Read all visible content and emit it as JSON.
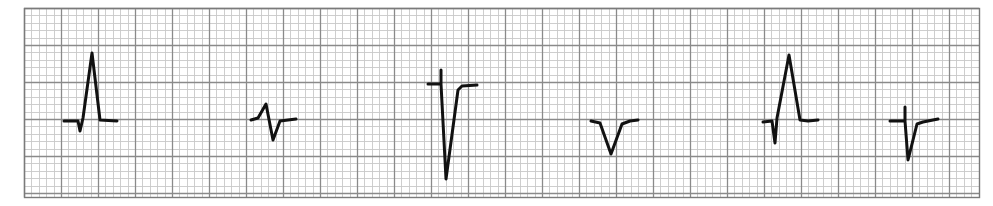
{
  "figure": {
    "title": ""
  },
  "grid": {
    "x0": 24,
    "y0": 8,
    "x1": 979,
    "y1": 197,
    "minor_px": 7.4,
    "minor_per_major": 5,
    "minor_color": "#c8c8c8",
    "major_color": "#8a8a8a",
    "border_color": "#7a7a7a",
    "paper_color": "#ffffff"
  },
  "trace": {
    "color": "#111111",
    "width": 3
  },
  "complexes": [
    {
      "name": "complex-1",
      "shape": "upright-tall-R",
      "points": [
        [
          64,
          121
        ],
        [
          78,
          121
        ],
        [
          80,
          131
        ],
        [
          83,
          118
        ],
        [
          92,
          53
        ],
        [
          100,
          120
        ],
        [
          117,
          121
        ]
      ]
    },
    {
      "name": "complex-2",
      "shape": "small-biphasic",
      "points": [
        [
          251,
          120
        ],
        [
          258,
          118
        ],
        [
          266,
          104
        ],
        [
          273,
          140
        ],
        [
          280,
          121
        ],
        [
          296,
          119
        ]
      ]
    },
    {
      "name": "complex-3",
      "shape": "deep-QS",
      "points": [
        [
          428,
          84
        ],
        [
          441,
          84
        ],
        [
          441,
          70
        ],
        [
          441,
          84
        ],
        [
          446,
          179
        ],
        [
          458,
          90
        ],
        [
          462,
          86
        ],
        [
          477,
          85
        ]
      ]
    },
    {
      "name": "complex-4",
      "shape": "QS",
      "points": [
        [
          591,
          121
        ],
        [
          600,
          123
        ],
        [
          611,
          154
        ],
        [
          622,
          124
        ],
        [
          630,
          121
        ],
        [
          638,
          120
        ]
      ]
    },
    {
      "name": "complex-5",
      "shape": "upright-tall-R",
      "points": [
        [
          763,
          122
        ],
        [
          772,
          121
        ],
        [
          775,
          143
        ],
        [
          777,
          118
        ],
        [
          789,
          55
        ],
        [
          800,
          120
        ],
        [
          808,
          121
        ],
        [
          818,
          120
        ]
      ]
    },
    {
      "name": "complex-6",
      "shape": "rS-deep",
      "points": [
        [
          890,
          121
        ],
        [
          905,
          121
        ],
        [
          905,
          107
        ],
        [
          905,
          121
        ],
        [
          908,
          160
        ],
        [
          917,
          124
        ],
        [
          923,
          122
        ],
        [
          938,
          119
        ]
      ]
    }
  ]
}
